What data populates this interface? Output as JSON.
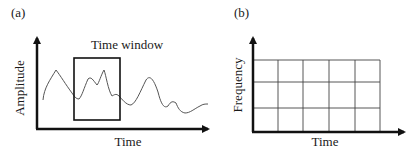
{
  "panels": [
    {
      "id": "a",
      "label": "(a)",
      "title": "Time window",
      "xlabel": "Time",
      "ylabel": "Amplitude",
      "signal_color": "#555555",
      "window": {
        "x": 74,
        "y": 58,
        "w": 46,
        "h": 62
      }
    },
    {
      "id": "b",
      "label": "(b)",
      "xlabel": "Time",
      "ylabel": "Frequency",
      "grid": {
        "cols": 5,
        "rows": 3,
        "x": 253,
        "y": 60,
        "w": 127,
        "h": 72
      },
      "grid_color": "#444444"
    }
  ],
  "colors": {
    "axis": "#111111",
    "text": "#1a1a1a"
  }
}
